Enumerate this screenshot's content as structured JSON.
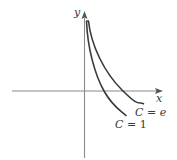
{
  "diagram": {
    "axes": {
      "x_label": "x",
      "y_label": "y"
    },
    "curves": [
      {
        "name": "curve-c-1",
        "label_lhs": "C",
        "label_eq": " = ",
        "label_rhs": "1"
      },
      {
        "name": "curve-c-e",
        "label_lhs": "C",
        "label_eq": " = ",
        "label_rhs": "e"
      }
    ],
    "colors": {
      "axis": "#8a8a8a",
      "curve": "#3a3a3a",
      "text": "#3a3a3a"
    }
  }
}
